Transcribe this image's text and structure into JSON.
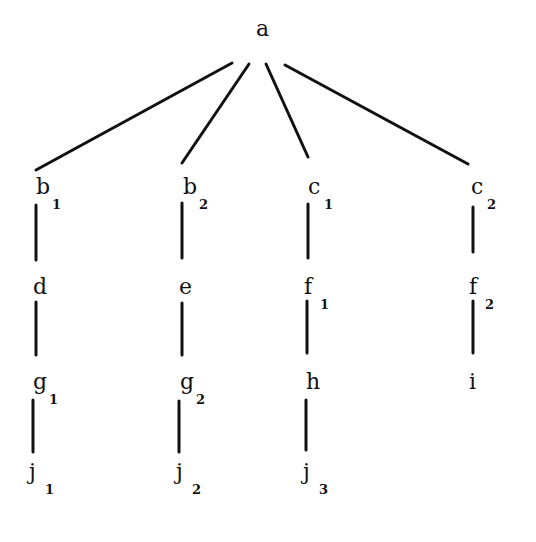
{
  "diagram": {
    "type": "tree",
    "root": "a",
    "nodes": [
      {
        "id": "a",
        "base": "a",
        "sub": "",
        "x": 263,
        "y": 32
      },
      {
        "id": "b1",
        "base": "b",
        "sub": "1",
        "x": 43,
        "y": 190
      },
      {
        "id": "b2",
        "base": "b",
        "sub": "2",
        "x": 190,
        "y": 190
      },
      {
        "id": "c1",
        "base": "c",
        "sub": "1",
        "x": 315,
        "y": 190
      },
      {
        "id": "c2",
        "base": "c",
        "sub": "2",
        "x": 478,
        "y": 190
      },
      {
        "id": "d",
        "base": "d",
        "sub": "",
        "x": 40,
        "y": 290
      },
      {
        "id": "e",
        "base": "e",
        "sub": "",
        "x": 186,
        "y": 290
      },
      {
        "id": "f1",
        "base": "f",
        "sub": "1",
        "x": 311,
        "y": 290
      },
      {
        "id": "f2",
        "base": "f",
        "sub": "2",
        "x": 476,
        "y": 290
      },
      {
        "id": "g1",
        "base": "g",
        "sub": "1",
        "x": 40,
        "y": 385
      },
      {
        "id": "g2",
        "base": "g",
        "sub": "2",
        "x": 187,
        "y": 385
      },
      {
        "id": "h",
        "base": "h",
        "sub": "",
        "x": 313,
        "y": 385
      },
      {
        "id": "i",
        "base": "i",
        "sub": "",
        "x": 476,
        "y": 385
      },
      {
        "id": "j1",
        "base": "j",
        "sub": "1",
        "x": 36,
        "y": 475
      },
      {
        "id": "j2",
        "base": "j",
        "sub": "2",
        "x": 183,
        "y": 475
      },
      {
        "id": "j3",
        "base": "j",
        "sub": "3",
        "x": 310,
        "y": 475
      }
    ],
    "edges": [
      {
        "from": "a",
        "to": "b1",
        "x1": 232,
        "y1": 63,
        "x2": 36,
        "y2": 170
      },
      {
        "from": "a",
        "to": "b2",
        "x1": 249,
        "y1": 64,
        "x2": 182,
        "y2": 163
      },
      {
        "from": "a",
        "to": "c1",
        "x1": 266,
        "y1": 64,
        "x2": 308,
        "y2": 157
      },
      {
        "from": "a",
        "to": "c2",
        "x1": 285,
        "y1": 65,
        "x2": 468,
        "y2": 164
      },
      {
        "from": "b1",
        "to": "d",
        "x1": 36,
        "y1": 205,
        "x2": 36,
        "y2": 260
      },
      {
        "from": "b2",
        "to": "e",
        "x1": 182,
        "y1": 203,
        "x2": 182,
        "y2": 258
      },
      {
        "from": "c1",
        "to": "f1",
        "x1": 308,
        "y1": 204,
        "x2": 308,
        "y2": 258
      },
      {
        "from": "c2",
        "to": "f2",
        "x1": 473,
        "y1": 207,
        "x2": 473,
        "y2": 252
      },
      {
        "from": "d",
        "to": "g1",
        "x1": 36,
        "y1": 302,
        "x2": 36,
        "y2": 355
      },
      {
        "from": "e",
        "to": "g2",
        "x1": 182,
        "y1": 303,
        "x2": 182,
        "y2": 355
      },
      {
        "from": "f1",
        "to": "h",
        "x1": 307,
        "y1": 301,
        "x2": 307,
        "y2": 353
      },
      {
        "from": "f2",
        "to": "i",
        "x1": 473,
        "y1": 301,
        "x2": 473,
        "y2": 353
      },
      {
        "from": "g1",
        "to": "j1",
        "x1": 33,
        "y1": 400,
        "x2": 33,
        "y2": 452
      },
      {
        "from": "g2",
        "to": "j2",
        "x1": 179,
        "y1": 401,
        "x2": 179,
        "y2": 452
      },
      {
        "from": "h",
        "to": "j3",
        "x1": 306,
        "y1": 400,
        "x2": 306,
        "y2": 450
      }
    ]
  }
}
